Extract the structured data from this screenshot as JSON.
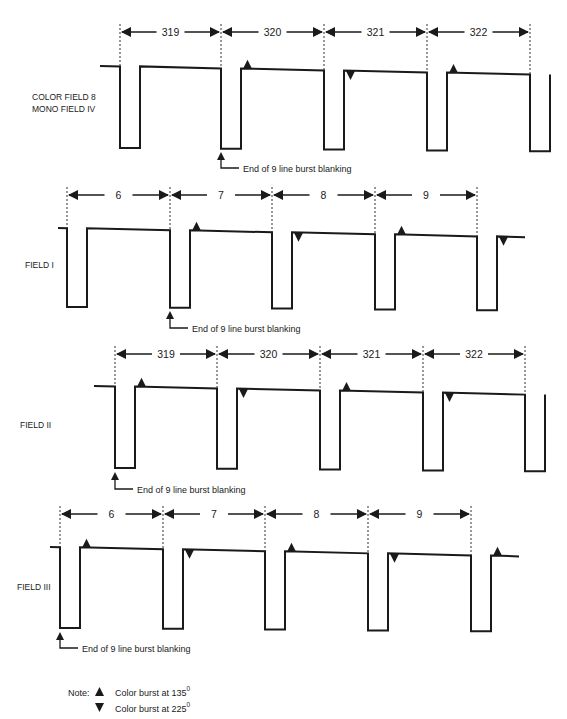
{
  "panels": [
    {
      "id": "color-field-8",
      "label_lines": [
        "COLOR FIELD 8",
        "MONO FIELD IV"
      ],
      "lines": [
        "319",
        "320",
        "321",
        "322"
      ],
      "bursts": [
        "none",
        "up",
        "down",
        "up"
      ],
      "trailing_burst": "none",
      "annotation": "End of 9 line burst blanking"
    },
    {
      "id": "field-i",
      "label_lines": [
        "FIELD I"
      ],
      "lines": [
        "6",
        "7",
        "8",
        "9"
      ],
      "bursts": [
        "none",
        "up",
        "down",
        "up"
      ],
      "trailing_burst": "down",
      "annotation": "End of 9 line burst blanking"
    },
    {
      "id": "field-ii",
      "label_lines": [
        "FIELD II"
      ],
      "lines": [
        "319",
        "320",
        "321",
        "322"
      ],
      "bursts": [
        "up",
        "down",
        "up",
        "down"
      ],
      "trailing_burst": "none",
      "annotation": "End of 9 line burst blanking"
    },
    {
      "id": "field-iii",
      "label_lines": [
        "FIELD III"
      ],
      "lines": [
        "6",
        "7",
        "8",
        "9"
      ],
      "bursts": [
        "up",
        "down",
        "up",
        "down"
      ],
      "trailing_burst": "up",
      "annotation": "End of 9 line burst blanking"
    }
  ],
  "legend": {
    "prefix": "Note:",
    "items": [
      {
        "symbol": "up-triangle",
        "text": "Color burst at 135",
        "sup": "0"
      },
      {
        "symbol": "down-triangle",
        "text": "Color burst at 225",
        "sup": "0"
      }
    ]
  }
}
